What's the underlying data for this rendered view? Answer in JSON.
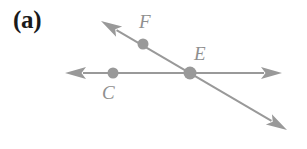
{
  "figure": {
    "panel_label": "(a)",
    "width": 307,
    "height": 149,
    "background_color": "#ffffff",
    "stroke_color": "#999999",
    "label_color": "#8f8f8f",
    "panel_label_color": "#1a1a1a"
  },
  "chart_data": {
    "type": "diagram",
    "title": "(a)",
    "lines": [
      {
        "name": "horizontal-line",
        "x1": 65,
        "y1": 73,
        "x2": 282,
        "y2": 73,
        "arrow_start": true,
        "arrow_end": true,
        "stroke": "#999999",
        "stroke_width": 2
      },
      {
        "name": "diagonal-line",
        "x1": 101,
        "y1": 21,
        "x2": 287,
        "y2": 130,
        "arrow_start": true,
        "arrow_end": true,
        "stroke": "#999999",
        "stroke_width": 2
      }
    ],
    "points": [
      {
        "label": "C",
        "x": 113,
        "y": 73,
        "radius": 5.5,
        "fill": "#999999",
        "label_x": 102,
        "label_y": 83
      },
      {
        "label": "F",
        "x": 143,
        "y": 44,
        "radius": 5.5,
        "fill": "#999999",
        "label_x": 139,
        "label_y": 12
      },
      {
        "label": "E",
        "x": 190,
        "y": 73,
        "radius": 6.5,
        "fill": "#999999",
        "label_x": 194,
        "label_y": 44
      }
    ],
    "annotations": [
      "(a)"
    ]
  },
  "labels": {
    "panel": "(a)",
    "point_f": "F",
    "point_e": "E",
    "point_c": "C"
  }
}
